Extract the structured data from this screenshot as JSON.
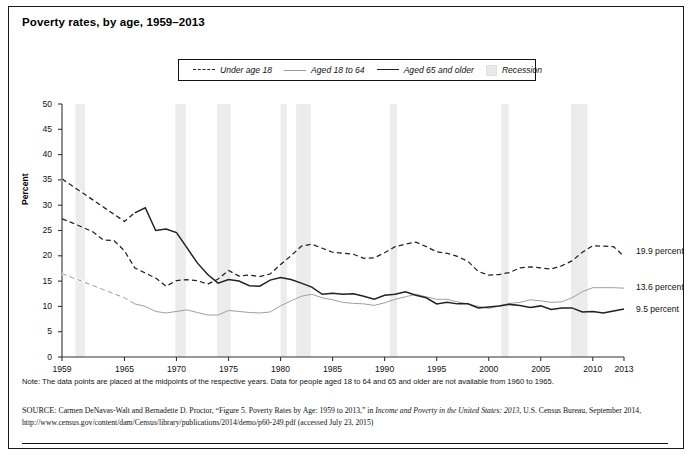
{
  "figure": {
    "title": "Poverty rates, by age, 1959–2013",
    "note": "Note: The data points are placed at the midpoints of the respective years. Data for people aged 18 to 64 and 65 and older are not available from 1960 to 1965.",
    "source_prefix": "SOURCE:",
    "source_part1": " Carmen DeNavas-Walt and Bernadette D. Proctor, “Figure 5. Poverty Rates by Age: 1959 to 2013,” in ",
    "source_italic1": "Income and Poverty in the United States: 2013",
    "source_part2": ", U.S. Census Bureau, September 2014, http://www.census.gov/content/dam/Census/library/publications/2014/demo/p60-249.pdf (accessed July 23, 2015)"
  },
  "legend": {
    "items": [
      {
        "label": "Under age 18",
        "style": "dashed",
        "color": "#222222"
      },
      {
        "label": "Aged 18 to 64",
        "style": "thin",
        "color": "#9a9a9a"
      },
      {
        "label": "Aged 65 and older",
        "style": "thick",
        "color": "#222222"
      },
      {
        "label": "Recession",
        "style": "band",
        "color": "#e9e9e9"
      }
    ]
  },
  "end_labels": [
    {
      "text": "19.9 percent",
      "series": "Under age 18"
    },
    {
      "text": "13.6 percent",
      "series": "Aged 18 to 64"
    },
    {
      "text": "9.5 percent",
      "series": "Aged 65 and older"
    }
  ],
  "chart_data": {
    "type": "line",
    "title": "Poverty rates, by age, 1959–2013",
    "xlabel": "",
    "ylabel": "Percent",
    "xlim": [
      1959,
      2013
    ],
    "ylim": [
      0,
      50
    ],
    "yticks": [
      0,
      5,
      10,
      15,
      20,
      25,
      30,
      35,
      40,
      45,
      50
    ],
    "xticks": [
      1959,
      1965,
      1970,
      1975,
      1980,
      1985,
      1990,
      1995,
      2000,
      2005,
      2010,
      2013
    ],
    "grid": false,
    "legend_position": "top-center",
    "x": [
      1959,
      1960,
      1961,
      1962,
      1963,
      1964,
      1965,
      1966,
      1967,
      1968,
      1969,
      1970,
      1971,
      1972,
      1973,
      1974,
      1975,
      1976,
      1977,
      1978,
      1979,
      1980,
      1981,
      1982,
      1983,
      1984,
      1985,
      1986,
      1987,
      1988,
      1989,
      1990,
      1991,
      1992,
      1993,
      1994,
      1995,
      1996,
      1997,
      1998,
      1999,
      2000,
      2001,
      2002,
      2003,
      2004,
      2005,
      2006,
      2007,
      2008,
      2009,
      2010,
      2011,
      2012,
      2013
    ],
    "series": [
      {
        "name": "Under age 18",
        "style": "dashed",
        "color": "#222222",
        "values": [
          27.3,
          26.5,
          25.6,
          24.7,
          23.1,
          23.0,
          21.0,
          17.6,
          16.6,
          15.6,
          14.0,
          15.1,
          15.3,
          15.1,
          14.4,
          15.4,
          17.1,
          16.0,
          16.2,
          15.9,
          16.4,
          18.3,
          20.0,
          21.9,
          22.3,
          21.5,
          20.7,
          20.5,
          20.3,
          19.5,
          19.6,
          20.6,
          21.8,
          22.3,
          22.7,
          21.8,
          20.8,
          20.5,
          19.9,
          18.9,
          16.9,
          16.2,
          16.3,
          16.7,
          17.6,
          17.8,
          17.6,
          17.4,
          18.0,
          19.0,
          20.7,
          22.0,
          21.9,
          21.8,
          19.9
        ]
      },
      {
        "name": "Aged 18 to 64",
        "style": "thin",
        "color": "#9a9a9a",
        "values": [
          16.5,
          15.7,
          14.9,
          14.1,
          13.3,
          12.5,
          11.7,
          10.5,
          10.0,
          9.0,
          8.7,
          9.0,
          9.3,
          8.8,
          8.3,
          8.3,
          9.2,
          9.0,
          8.8,
          8.7,
          8.9,
          10.1,
          11.1,
          12.0,
          12.4,
          11.7,
          11.3,
          10.8,
          10.6,
          10.5,
          10.2,
          10.7,
          11.4,
          11.9,
          12.4,
          11.9,
          11.4,
          11.4,
          10.9,
          10.5,
          10.0,
          9.6,
          10.1,
          10.6,
          10.8,
          11.3,
          11.1,
          10.8,
          10.9,
          11.7,
          12.9,
          13.7,
          13.7,
          13.7,
          13.6
        ]
      },
      {
        "name": "Aged 65 and older",
        "style": "thick",
        "color": "#222222",
        "values": [
          35.2,
          33.8,
          32.4,
          31.0,
          29.6,
          28.2,
          26.8,
          28.5,
          29.5,
          25.0,
          25.3,
          24.6,
          21.6,
          18.6,
          16.3,
          14.6,
          15.3,
          15.0,
          14.1,
          14.0,
          15.2,
          15.7,
          15.3,
          14.6,
          13.8,
          12.4,
          12.6,
          12.4,
          12.5,
          12.0,
          11.4,
          12.2,
          12.4,
          12.9,
          12.2,
          11.7,
          10.5,
          10.8,
          10.5,
          10.5,
          9.7,
          9.9,
          10.1,
          10.4,
          10.2,
          9.8,
          10.1,
          9.4,
          9.7,
          9.7,
          8.9,
          9.0,
          8.7,
          9.1,
          9.5
        ]
      }
    ],
    "recessions": [
      {
        "start": 1960.3,
        "end": 1961.2
      },
      {
        "start": 1969.9,
        "end": 1970.9
      },
      {
        "start": 1973.9,
        "end": 1975.2
      },
      {
        "start": 1980.0,
        "end": 1980.6
      },
      {
        "start": 1981.5,
        "end": 1982.9
      },
      {
        "start": 1990.5,
        "end": 1991.2
      },
      {
        "start": 2001.2,
        "end": 2001.9
      },
      {
        "start": 2007.9,
        "end": 2009.5
      }
    ],
    "recession_color": "#ececec"
  }
}
